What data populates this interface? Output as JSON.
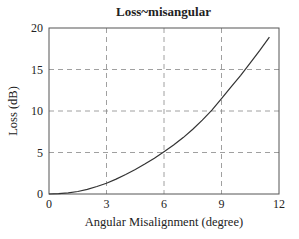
{
  "chart_data": {
    "type": "line",
    "title": "Loss~misangular",
    "xlabel": "Angular Misalignment (degree)",
    "ylabel": "Loss (dB)",
    "xlim": [
      0,
      12
    ],
    "ylim": [
      0,
      20
    ],
    "xticks": [
      0,
      3,
      6,
      9,
      12
    ],
    "yticks": [
      0,
      5,
      10,
      15,
      20
    ],
    "grid": "dashed",
    "legend": null,
    "series": [
      {
        "name": "Loss",
        "x": [
          0,
          0.5,
          1,
          1.5,
          2,
          2.5,
          3,
          3.5,
          4,
          4.5,
          5,
          5.5,
          6,
          6.5,
          7,
          7.5,
          8,
          8.5,
          9,
          9.5,
          10,
          10.5,
          11,
          11.5
        ],
        "y": [
          0,
          0.05,
          0.15,
          0.3,
          0.55,
          0.9,
          1.3,
          1.8,
          2.35,
          2.95,
          3.6,
          4.3,
          5.1,
          5.9,
          6.8,
          7.8,
          8.9,
          10.1,
          11.5,
          12.9,
          14.3,
          15.8,
          17.3,
          18.9
        ]
      }
    ]
  }
}
